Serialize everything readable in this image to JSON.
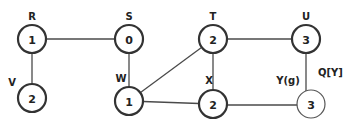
{
  "diagram": {
    "type": "graph",
    "nodes": [
      {
        "id": "R",
        "label": "R",
        "value": "1"
      },
      {
        "id": "S",
        "label": "S",
        "value": "0"
      },
      {
        "id": "T",
        "label": "T",
        "value": "2"
      },
      {
        "id": "U",
        "label": "U",
        "value": "3"
      },
      {
        "id": "V",
        "label": "V",
        "value": "2"
      },
      {
        "id": "W",
        "label": "W",
        "value": "1"
      },
      {
        "id": "X",
        "label": "X",
        "value": "2"
      },
      {
        "id": "Y",
        "label": "Y(g)",
        "value": "3",
        "highlighted": true
      }
    ],
    "edges": [
      {
        "from": "R",
        "to": "S"
      },
      {
        "from": "R",
        "to": "V"
      },
      {
        "from": "S",
        "to": "W"
      },
      {
        "from": "W",
        "to": "T"
      },
      {
        "from": "W",
        "to": "X"
      },
      {
        "from": "T",
        "to": "U"
      },
      {
        "from": "T",
        "to": "X"
      },
      {
        "from": "U",
        "to": "Y"
      },
      {
        "from": "X",
        "to": "Y"
      }
    ],
    "annotation": "Q[Y]"
  }
}
